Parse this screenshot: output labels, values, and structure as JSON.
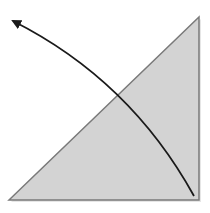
{
  "diagram": {
    "triangle": {
      "points": [
        [
          9,
          200
        ],
        [
          199,
          17
        ],
        [
          199,
          200
        ]
      ],
      "fill": "#d3d3d3",
      "stroke": "#7a7a7a",
      "shadow": "#e6e6e6"
    },
    "arrow": {
      "start": [
        194,
        196
      ],
      "end": [
        11,
        19
      ],
      "control": [
        130,
        80
      ],
      "color": "#1a1a1a",
      "head": "arrowhead-at-end"
    }
  }
}
